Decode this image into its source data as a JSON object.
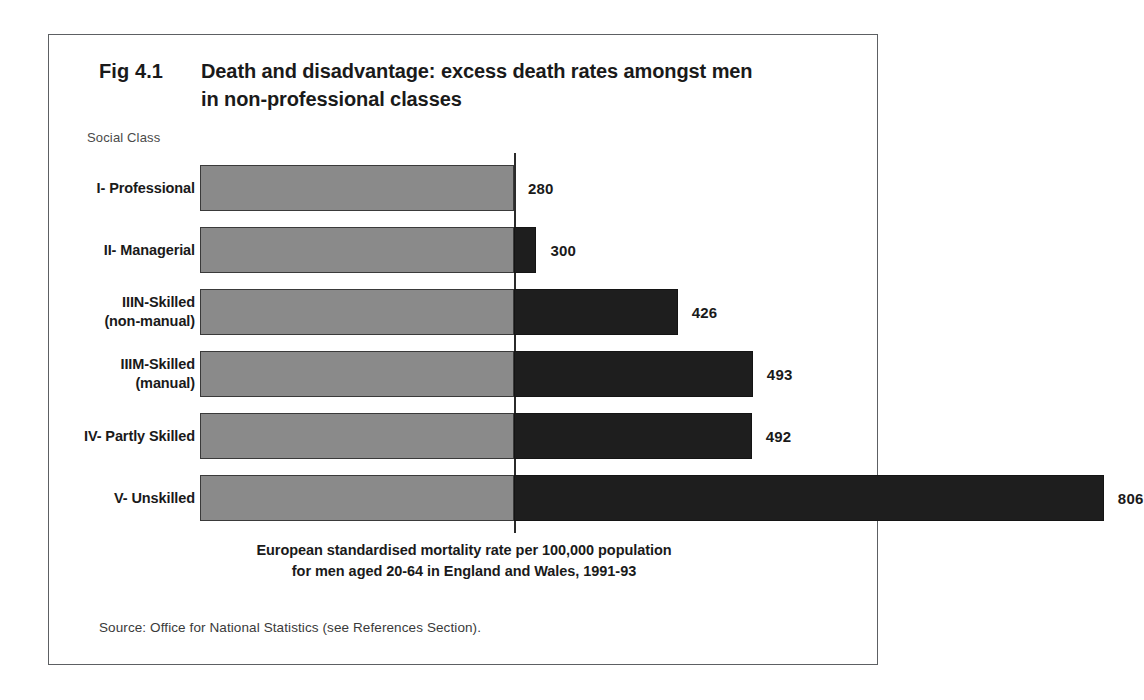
{
  "figure": {
    "number": "Fig 4.1",
    "title_lines": [
      "Death and disadvantage:  excess death rates amongst men",
      "in non-professional classes"
    ],
    "axis_caption": "Social Class",
    "axis_title_lines": [
      "European standardised mortality rate per 100,000 population",
      "for men aged 20-64 in England and Wales, 1991-93"
    ],
    "source_note": "Source:  Office for National Statistics (see References Section)."
  },
  "colors": {
    "base_bar": "#8a8a8a",
    "excess_bar": "#1e1e1e",
    "reference_line": "#2b2b2b",
    "frame": "#5d6063"
  },
  "chart_data": {
    "type": "bar",
    "orientation": "horizontal",
    "title": "Fig 4.1 Death and disadvantage:  excess death rates amongst men in non-professional classes",
    "xlabel": "European standardised mortality rate per 100,000 population for men aged 20-64 in England and Wales, 1991-93",
    "ylabel": "Social Class",
    "categories": [
      "I- Professional",
      "II- Managerial",
      "IIIN-Skilled (non-manual)",
      "IIIM-Skilled (manual)",
      "IV- Partly Skilled",
      "V- Unskilled"
    ],
    "values": [
      280,
      300,
      426,
      493,
      492,
      806
    ],
    "value_labels": [
      "280",
      "300",
      "426",
      "493",
      "492",
      "806"
    ],
    "reference_value": 280,
    "xlim": [
      0,
      806
    ],
    "grid": false,
    "legend": false,
    "bars": [
      {
        "category_lines": [
          "I- Professional"
        ],
        "value": 280,
        "label": "280",
        "base": 280,
        "excess": 0
      },
      {
        "category_lines": [
          "II- Managerial"
        ],
        "value": 300,
        "label": "300",
        "base": 280,
        "excess": 20
      },
      {
        "category_lines": [
          "IIIN-Skilled",
          "(non-manual)"
        ],
        "value": 426,
        "label": "426",
        "base": 280,
        "excess": 146
      },
      {
        "category_lines": [
          "IIIM-Skilled",
          "(manual)"
        ],
        "value": 493,
        "label": "493",
        "base": 280,
        "excess": 213
      },
      {
        "category_lines": [
          "IV- Partly Skilled"
        ],
        "value": 492,
        "label": "492",
        "base": 280,
        "excess": 212
      },
      {
        "category_lines": [
          "V- Unskilled"
        ],
        "value": 806,
        "label": "806",
        "base": 280,
        "excess": 526
      }
    ]
  }
}
